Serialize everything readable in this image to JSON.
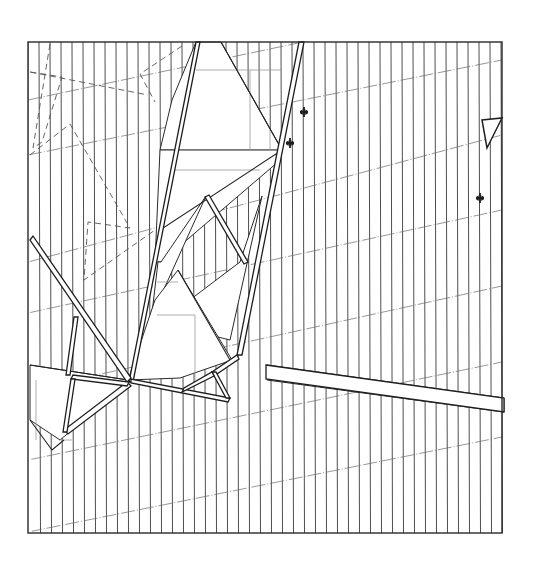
{
  "drawing": {
    "title": "",
    "type": "architectural-plan",
    "frame": {
      "x": 28,
      "y": 42,
      "width": 474,
      "height": 491
    },
    "vertical_lines": {
      "start_x": 28,
      "end_x": 502,
      "spacing": 11
    },
    "slanted_lines": [
      {
        "x1": 28,
        "y1": 100,
        "x2": 502,
        "y2": 0
      },
      {
        "x1": 28,
        "y1": 155,
        "x2": 502,
        "y2": 60
      },
      {
        "x1": 28,
        "y1": 262,
        "x2": 502,
        "y2": 135
      },
      {
        "x1": 28,
        "y1": 313,
        "x2": 502,
        "y2": 210
      },
      {
        "x1": 28,
        "y1": 390,
        "x2": 502,
        "y2": 286
      },
      {
        "x1": 28,
        "y1": 460,
        "x2": 502,
        "y2": 362
      },
      {
        "x1": 28,
        "y1": 532,
        "x2": 502,
        "y2": 437
      }
    ],
    "markers": [
      {
        "name": "cross-marker-1",
        "x": 304,
        "y": 112
      },
      {
        "name": "cross-marker-2",
        "x": 290,
        "y": 143
      },
      {
        "name": "cross-marker-3",
        "x": 480,
        "y": 198
      }
    ],
    "colors": {
      "ink": "#2a2a2a",
      "paper": "#ffffff",
      "hatch": "#3a3a3a"
    }
  }
}
